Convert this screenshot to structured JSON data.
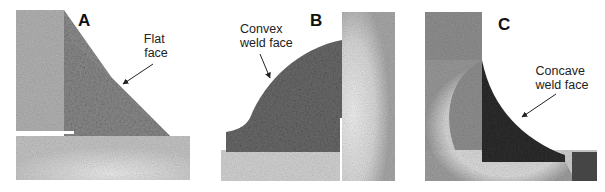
{
  "figure": {
    "panels": [
      {
        "id": "A",
        "label": "A",
        "callout_lines": [
          "Flat",
          "face"
        ],
        "profile": "flat"
      },
      {
        "id": "B",
        "label": "B",
        "callout_lines": [
          "Convex",
          "weld face"
        ],
        "profile": "convex"
      },
      {
        "id": "C",
        "label": "C",
        "callout_lines": [
          "Concave",
          "weld face"
        ],
        "profile": "concave"
      }
    ]
  },
  "colors": {
    "background": "#ffffff",
    "base_metal": "#b8b8b8",
    "base_metal_light": "#dcdcdc",
    "haz": "#e6e6e6",
    "weld_A": "#8c8c8c",
    "weld_B": "#6e6e6e",
    "weld_C": "#2e2e2e",
    "text": "#111111"
  }
}
